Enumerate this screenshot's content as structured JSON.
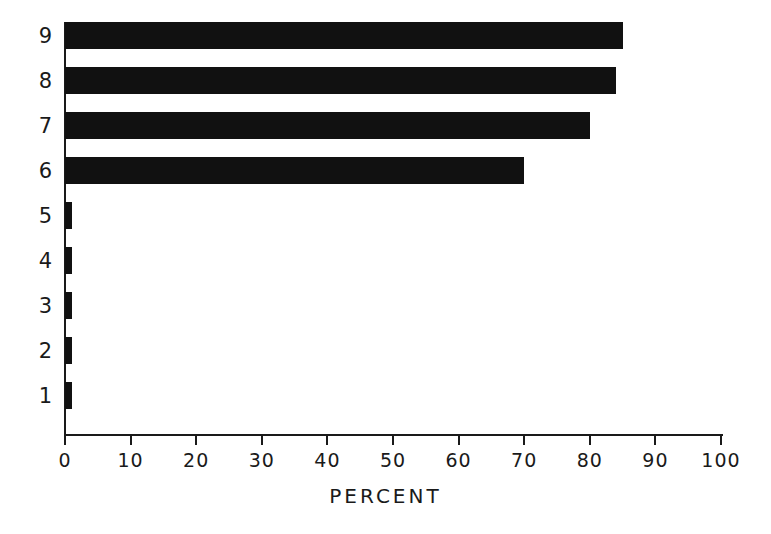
{
  "chart_data": {
    "type": "bar",
    "orientation": "horizontal",
    "title": "",
    "xlabel": "PERCENT",
    "ylabel": "",
    "categories": [
      "1",
      "2",
      "3",
      "4",
      "5",
      "6",
      "7",
      "8",
      "9"
    ],
    "values": [
      1,
      1,
      1,
      1,
      1,
      70,
      80,
      84,
      85
    ],
    "xlim": [
      0,
      100
    ],
    "xticks": [
      0,
      10,
      20,
      30,
      40,
      50,
      60,
      70,
      80,
      90,
      100
    ],
    "xtick_labels": [
      "0",
      "10",
      "20",
      "30",
      "40",
      "50",
      "60",
      "70",
      "80",
      "90",
      "100"
    ],
    "grid": false,
    "legend": false,
    "bar_color": "#111111",
    "background_color": "#ffffff",
    "axis_color": "#1a1a1a"
  }
}
